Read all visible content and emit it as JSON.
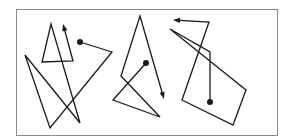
{
  "diagram": {
    "width": 286,
    "height": 140,
    "background": "#ffffff",
    "stroke_color": "#1a1a1a",
    "frame": {
      "x": 16,
      "y": 9,
      "width": 261,
      "height": 126,
      "color": "#8a8a8a"
    },
    "paths": [
      {
        "id": "left-path",
        "start_dot": [
          80,
          42
        ],
        "points": [
          [
            80,
            42
          ],
          [
            112,
            52
          ],
          [
            50,
            128
          ],
          [
            25,
            55
          ],
          [
            80,
            123
          ],
          [
            51,
            24
          ],
          [
            42,
            62
          ],
          [
            73,
            61
          ],
          [
            63,
            24
          ]
        ],
        "arrow_direction": "up"
      },
      {
        "id": "middle-path",
        "start_dot": [
          146,
          63
        ],
        "points": [
          [
            146,
            63
          ],
          [
            113,
            100
          ],
          [
            160,
            117
          ],
          [
            121,
            76
          ],
          [
            140,
            16
          ],
          [
            164,
            99
          ]
        ],
        "arrow_direction": "down"
      },
      {
        "id": "right-path",
        "start_dot": [
          210,
          102
        ],
        "points": [
          [
            210,
            102
          ],
          [
            210,
            52
          ],
          [
            170,
            29
          ],
          [
            246,
            90
          ],
          [
            233,
            125
          ],
          [
            182,
            100
          ],
          [
            209,
            22
          ],
          [
            173,
            20
          ]
        ],
        "arrow_direction": "left"
      }
    ]
  }
}
